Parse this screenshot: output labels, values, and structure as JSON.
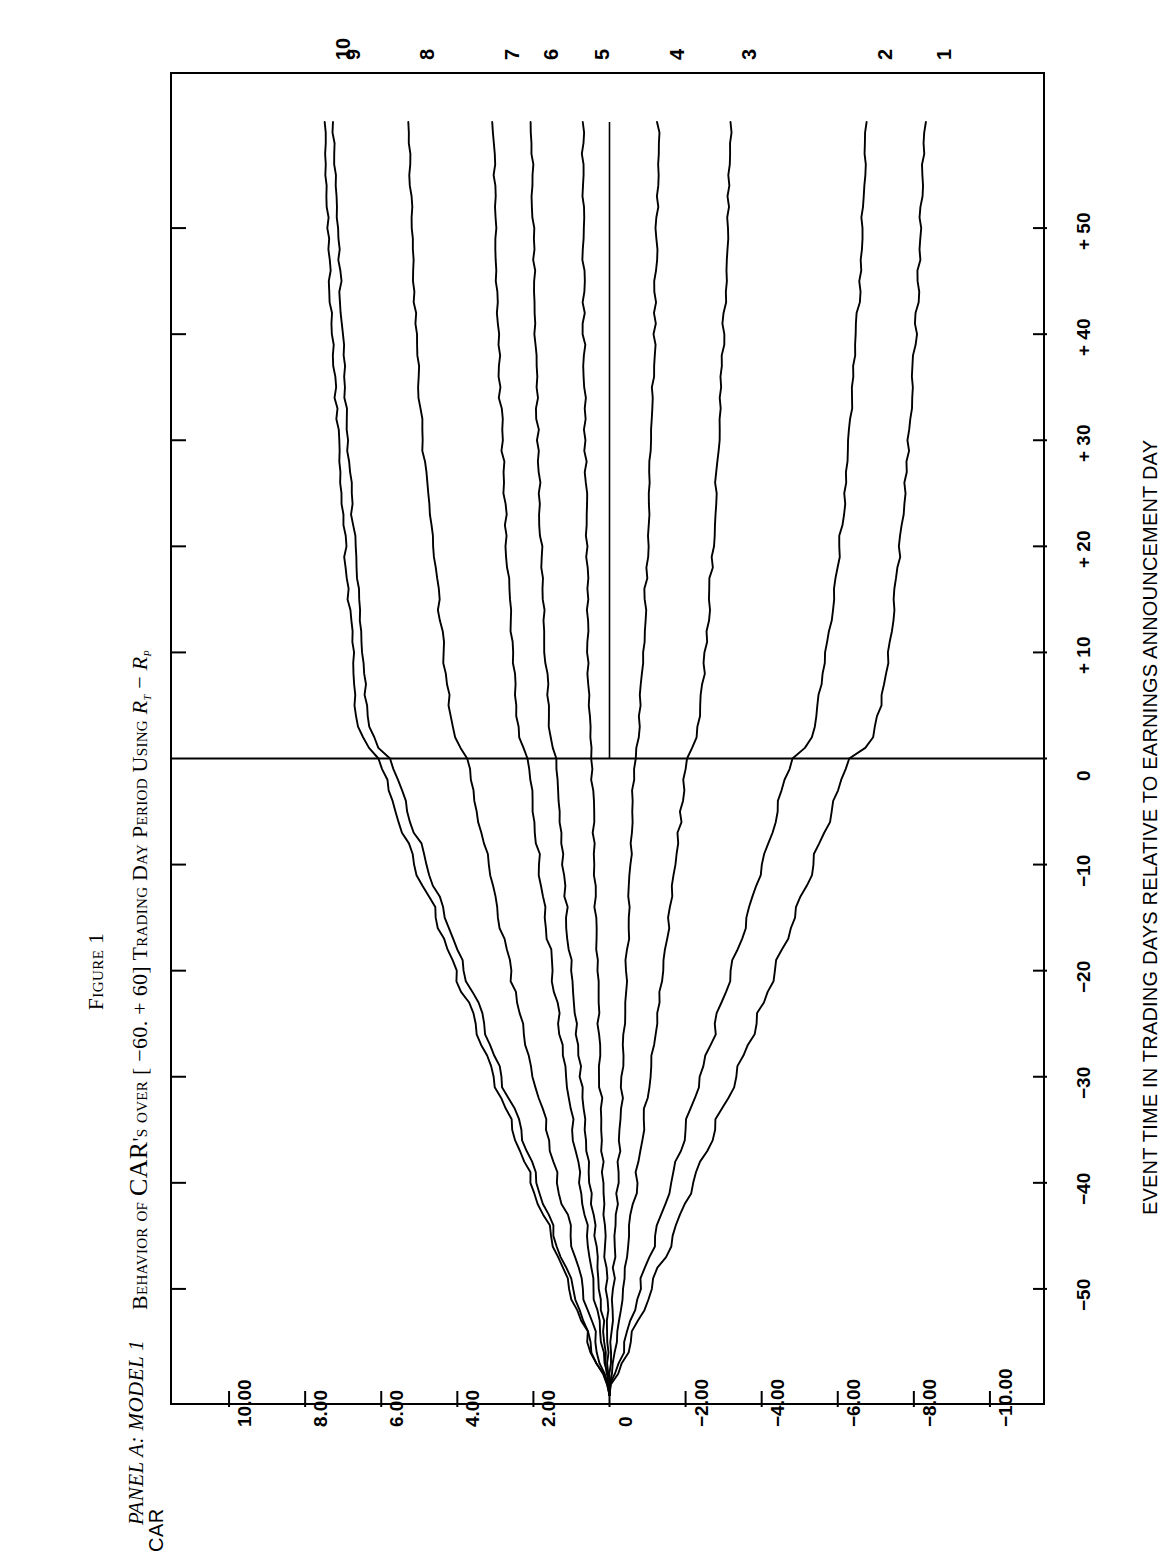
{
  "figure": {
    "number": "Figure 1",
    "title_prefix": "Behavior of ",
    "title_car": "CAR",
    "title_rest": "'s over [ −60. + 60] Trading Day Period Using ",
    "title_symbol_r_i": "R",
    "title_symbol_minus": " − ",
    "title_symbol_r_p": "R",
    "panel_label": "PANEL A: MODEL 1"
  },
  "formula": {
    "lhs": "FE",
    "lhs_sup": "1",
    "lhs_sub": "i",
    "equals": " = ",
    "numerator": "Q",
    "numerator_sub": "i,t",
    "numerator_minus": " − E(Q",
    "numerator_sub2": "i,t",
    "numerator_close": ")",
    "denominator_open": "|Q",
    "denominator_sub": "i,t",
    "denominator_close": "|"
  },
  "axes": {
    "y_title": "CAR",
    "x_title": "EVENT TIME IN TRADING DAYS RELATIVE TO EARNINGS ANNOUNCEMENT DAY",
    "y_ticks": [
      "10.00",
      "8.00",
      "6.00",
      "4.00",
      "2.00",
      "0",
      "−2.00",
      "−4.00",
      "−6.00",
      "−8.00",
      "−10.00"
    ],
    "y_tick_values": [
      10,
      8,
      6,
      4,
      2,
      0,
      -2,
      -4,
      -6,
      -8,
      -10
    ],
    "x_ticks": [
      "−50",
      "−40",
      "−30",
      "−20",
      "−10",
      "0",
      "+ 10",
      "+ 20",
      "+ 30",
      "+ 40",
      "+ 50"
    ],
    "x_tick_values": [
      -50,
      -40,
      -30,
      -20,
      -10,
      0,
      10,
      20,
      30,
      40,
      50
    ],
    "x_range": [
      -60,
      60
    ],
    "y_range": [
      -11.5,
      11.5
    ],
    "event_day_line": 0
  },
  "curve_labels": [
    "10",
    "9",
    "8",
    "7",
    "6",
    "5",
    "4",
    "3",
    "2",
    "1"
  ],
  "colors": {
    "line": "#000000",
    "background": "#ffffff",
    "frame": "#000000"
  },
  "chart_data": {
    "type": "line",
    "subtitle": "PANEL A: MODEL 1",
    "xlabel": "EVENT TIME IN TRADING DAYS RELATIVE TO EARNINGS ANNOUNCEMENT DAY",
    "ylabel": "CAR",
    "xlim": [
      -60,
      60
    ],
    "ylim": [
      -11.5,
      11.5
    ],
    "xticks": [
      -50,
      -40,
      -30,
      -20,
      -10,
      0,
      10,
      20,
      30,
      40,
      50
    ],
    "yticks": [
      10,
      8,
      6,
      4,
      2,
      0,
      -2,
      -4,
      -6,
      -8,
      -10
    ],
    "grid": false,
    "legend": "curve end labels at right edge (day +60)",
    "annotations": [
      "FE¹ᵢ = (Qᵢ,ₜ − E(Qᵢ,ₜ)) / |Qᵢ,ₜ|"
    ],
    "x": [
      -60,
      -55,
      -50,
      -45,
      -40,
      -35,
      -30,
      -25,
      -20,
      -15,
      -10,
      -5,
      -2,
      -1,
      0,
      1,
      2,
      3,
      5,
      10,
      15,
      20,
      25,
      30,
      35,
      40,
      45,
      50,
      55,
      60
    ],
    "series": [
      {
        "name": "10",
        "values": [
          0.0,
          0.55,
          1.05,
          1.55,
          2.05,
          2.55,
          3.05,
          3.55,
          4.05,
          4.55,
          5.1,
          5.6,
          5.85,
          5.95,
          6.05,
          6.35,
          6.5,
          6.6,
          6.7,
          6.75,
          6.85,
          6.95,
          7.05,
          7.12,
          7.2,
          7.28,
          7.35,
          7.4,
          7.45,
          7.5
        ]
      },
      {
        "name": "9",
        "values": [
          0.0,
          0.5,
          0.95,
          1.45,
          1.9,
          2.35,
          2.85,
          3.3,
          3.8,
          4.3,
          4.8,
          5.3,
          5.55,
          5.65,
          5.75,
          6.05,
          6.2,
          6.3,
          6.4,
          6.5,
          6.6,
          6.7,
          6.8,
          6.88,
          6.95,
          7.02,
          7.08,
          7.14,
          7.2,
          7.25
        ]
      },
      {
        "name": "8",
        "values": [
          0.0,
          0.35,
          0.7,
          1.0,
          1.35,
          1.65,
          2.0,
          2.3,
          2.6,
          2.9,
          3.2,
          3.5,
          3.65,
          3.7,
          3.75,
          3.95,
          4.05,
          4.12,
          4.2,
          4.35,
          4.5,
          4.65,
          4.78,
          4.9,
          5.0,
          5.08,
          5.15,
          5.2,
          5.25,
          5.3
        ]
      },
      {
        "name": "7",
        "values": [
          0.0,
          0.2,
          0.4,
          0.58,
          0.78,
          0.95,
          1.15,
          1.32,
          1.5,
          1.68,
          1.85,
          2.0,
          2.08,
          2.12,
          2.15,
          2.28,
          2.35,
          2.4,
          2.45,
          2.55,
          2.62,
          2.7,
          2.76,
          2.82,
          2.88,
          2.92,
          2.96,
          3.0,
          3.03,
          3.05
        ]
      },
      {
        "name": "6",
        "values": [
          0.0,
          0.12,
          0.25,
          0.38,
          0.5,
          0.62,
          0.75,
          0.88,
          1.0,
          1.12,
          1.22,
          1.32,
          1.38,
          1.4,
          1.42,
          1.5,
          1.55,
          1.58,
          1.62,
          1.68,
          1.74,
          1.8,
          1.85,
          1.88,
          1.92,
          1.95,
          1.98,
          2.0,
          2.02,
          2.04
        ]
      },
      {
        "name": "5",
        "values": [
          0.0,
          0.04,
          0.08,
          0.12,
          0.16,
          0.2,
          0.24,
          0.28,
          0.32,
          0.36,
          0.4,
          0.43,
          0.45,
          0.46,
          0.47,
          0.5,
          0.52,
          0.53,
          0.54,
          0.56,
          0.58,
          0.6,
          0.62,
          0.64,
          0.66,
          0.67,
          0.68,
          0.69,
          0.7,
          0.7
        ]
      },
      {
        "name": "4",
        "values": [
          0.0,
          -0.05,
          -0.1,
          -0.16,
          -0.22,
          -0.28,
          -0.34,
          -0.4,
          -0.45,
          -0.5,
          -0.55,
          -0.6,
          -0.63,
          -0.65,
          -0.66,
          -0.72,
          -0.76,
          -0.78,
          -0.82,
          -0.88,
          -0.94,
          -1.0,
          -1.05,
          -1.1,
          -1.14,
          -1.18,
          -1.21,
          -1.24,
          -1.26,
          -1.28
        ]
      },
      {
        "name": "3",
        "values": [
          0.0,
          -0.17,
          -0.35,
          -0.52,
          -0.7,
          -0.88,
          -1.05,
          -1.22,
          -1.4,
          -1.56,
          -1.72,
          -1.88,
          -1.96,
          -2.0,
          -2.04,
          -2.18,
          -2.26,
          -2.32,
          -2.4,
          -2.52,
          -2.62,
          -2.72,
          -2.8,
          -2.88,
          -2.94,
          -3.0,
          -3.05,
          -3.1,
          -3.14,
          -3.18
        ]
      },
      {
        "name": "2",
        "values": [
          0.0,
          -0.4,
          -0.8,
          -1.2,
          -1.6,
          -2.0,
          -2.4,
          -2.8,
          -3.2,
          -3.6,
          -4.0,
          -4.4,
          -4.6,
          -4.7,
          -4.8,
          -5.15,
          -5.3,
          -5.4,
          -5.5,
          -5.7,
          -5.9,
          -6.05,
          -6.2,
          -6.3,
          -6.4,
          -6.5,
          -6.58,
          -6.65,
          -6.7,
          -6.75
        ]
      },
      {
        "name": "1",
        "values": [
          0.0,
          -0.55,
          -1.1,
          -1.65,
          -2.2,
          -2.75,
          -3.3,
          -3.85,
          -4.35,
          -4.85,
          -5.35,
          -5.85,
          -6.1,
          -6.2,
          -6.3,
          -6.7,
          -6.9,
          -7.0,
          -7.12,
          -7.35,
          -7.5,
          -7.62,
          -7.75,
          -7.85,
          -7.95,
          -8.05,
          -8.12,
          -8.18,
          -8.24,
          -8.3
        ]
      }
    ]
  }
}
